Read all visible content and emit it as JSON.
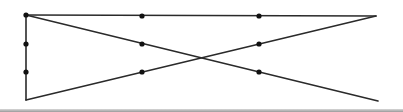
{
  "diagram": {
    "type": "line-figure-with-points",
    "stroke_color": "#2a2a2a",
    "point_color": "#111111",
    "line_width": 1.6,
    "point_radius": 2.6,
    "lines": [
      {
        "name": "top-edge",
        "x1": 26,
        "y1": 15,
        "x2": 376,
        "y2": 16
      },
      {
        "name": "left-edge",
        "x1": 26,
        "y1": 15,
        "x2": 26,
        "y2": 100
      },
      {
        "name": "descending-diagonal",
        "x1": 26,
        "y1": 15,
        "x2": 378,
        "y2": 101
      },
      {
        "name": "ascending-diagonal",
        "x1": 26,
        "y1": 100,
        "x2": 376,
        "y2": 16
      }
    ],
    "points": [
      {
        "name": "vertex-top-left",
        "x": 26,
        "y": 15
      },
      {
        "name": "left-point-1",
        "x": 26,
        "y": 44
      },
      {
        "name": "left-point-2",
        "x": 26,
        "y": 72
      },
      {
        "name": "top-point-1",
        "x": 142,
        "y": 16
      },
      {
        "name": "top-point-2",
        "x": 259,
        "y": 16
      },
      {
        "name": "mid-point-1",
        "x": 142,
        "y": 44
      },
      {
        "name": "mid-point-2",
        "x": 142,
        "y": 72
      },
      {
        "name": "mid-point-3",
        "x": 259,
        "y": 44
      },
      {
        "name": "mid-point-4",
        "x": 259,
        "y": 72
      }
    ]
  }
}
